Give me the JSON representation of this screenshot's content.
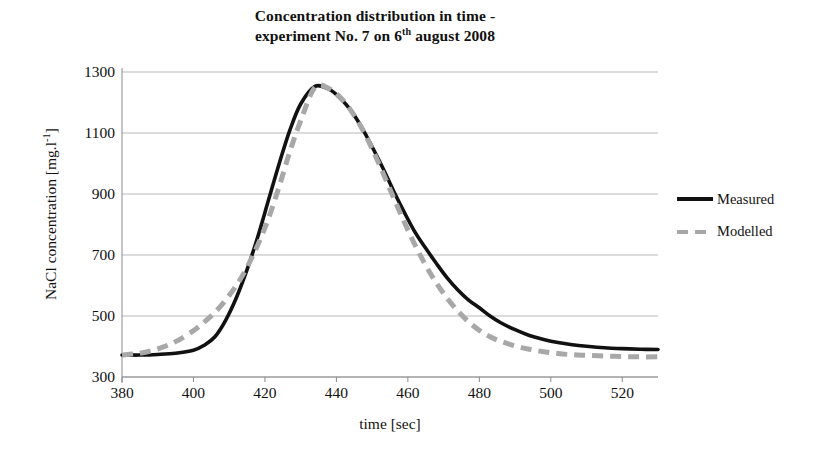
{
  "chart_data": {
    "type": "line",
    "title": "Concentration distribution in time - experiment No. 7 on 6th august 2008",
    "title_line1": "Concentration distribution in time -",
    "title_line2_pre": "experiment No. 7 on 6",
    "title_line2_sup": "th",
    "title_line2_post": " august 2008",
    "xlabel": "time [sec]",
    "ylabel_pre": "NaCl concentration [mg.l",
    "ylabel_sup": "-1",
    "ylabel_post": "]",
    "ylabel": "NaCl concentration [mg.l-1]",
    "xlim": [
      380,
      530
    ],
    "ylim": [
      300,
      1300
    ],
    "xticks": [
      380,
      400,
      420,
      440,
      460,
      480,
      500,
      520
    ],
    "yticks": [
      300,
      500,
      700,
      900,
      1100,
      1300
    ],
    "grid": "horizontal",
    "legend_position": "right",
    "x": [
      380,
      385,
      390,
      395,
      400,
      403,
      406,
      409,
      412,
      415,
      418,
      421,
      424,
      427,
      430,
      434,
      438,
      441,
      444,
      447,
      450,
      453,
      456,
      459,
      462,
      465,
      468,
      471,
      474,
      477,
      480,
      483,
      486,
      490,
      494,
      498,
      502,
      506,
      510,
      515,
      520,
      525,
      530
    ],
    "series": [
      {
        "name": "Measured",
        "style": "solid",
        "color": "#111111",
        "values": [
          372,
          372,
          374,
          378,
          388,
          404,
          432,
          486,
          560,
          652,
          760,
          880,
          1000,
          1110,
          1195,
          1253,
          1243,
          1215,
          1175,
          1120,
          1055,
          985,
          910,
          840,
          775,
          722,
          672,
          625,
          585,
          552,
          527,
          500,
          478,
          455,
          436,
          423,
          413,
          406,
          401,
          396,
          393,
          391,
          390
        ]
      },
      {
        "name": "Modelled",
        "style": "dashed",
        "color": "#a8a8a8",
        "values": [
          372,
          378,
          392,
          416,
          452,
          480,
          512,
          552,
          600,
          660,
          733,
          820,
          925,
          1040,
          1140,
          1250,
          1245,
          1218,
          1175,
          1118,
          1048,
          970,
          888,
          808,
          733,
          666,
          608,
          558,
          516,
          481,
          453,
          432,
          417,
          402,
          391,
          383,
          377,
          373,
          371,
          369,
          367,
          366,
          366
        ]
      }
    ]
  },
  "legend": {
    "items": [
      {
        "label": "Measured"
      },
      {
        "label": "Modelled"
      }
    ]
  },
  "axes": {
    "y_tick_labels": [
      "1300",
      "1100",
      "900",
      "700",
      "500",
      "300"
    ],
    "x_tick_labels": [
      "380",
      "400",
      "420",
      "440",
      "460",
      "480",
      "500",
      "520"
    ]
  }
}
